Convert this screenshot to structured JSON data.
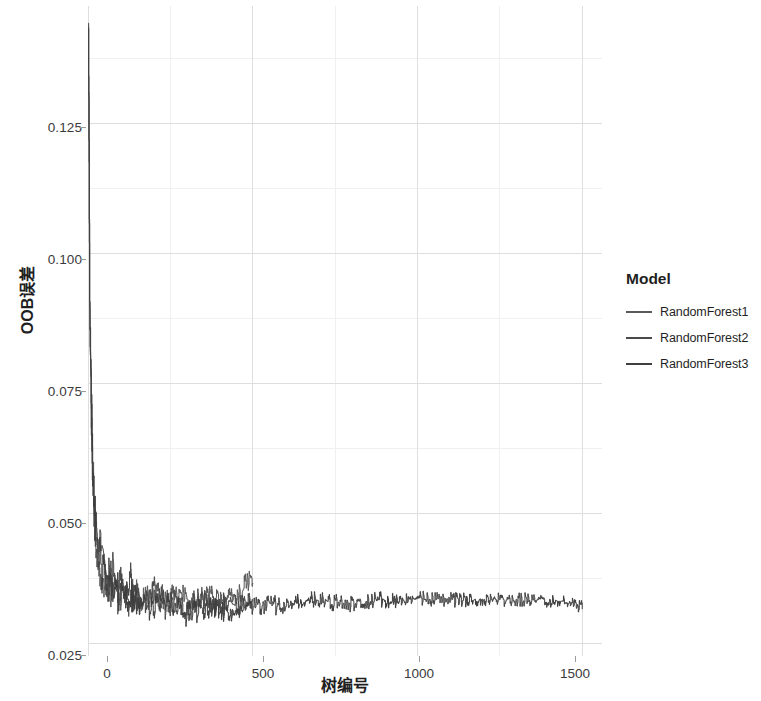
{
  "chart_data": {
    "type": "line",
    "title": "",
    "xlabel": "树编号",
    "ylabel": "OOB误差",
    "xlim": [
      0,
      1560
    ],
    "ylim": [
      0.0225,
      0.1475
    ],
    "xticks": [
      0,
      500,
      1000,
      1500
    ],
    "xticklabels": [
      "0",
      "500",
      "1000",
      "1500"
    ],
    "yticks": [
      0.025,
      0.05,
      0.075,
      0.1,
      0.125
    ],
    "yticklabels": [
      "0.025",
      "0.050",
      "0.075",
      "0.100",
      "0.125"
    ],
    "grid": true,
    "grid_minor": true,
    "legend_position": "right",
    "legend_title": "Model",
    "series": [
      {
        "name": "RandomForest1",
        "color": "#5a5a5a",
        "n_trees": 500,
        "x": [
          1,
          3,
          5,
          8,
          11,
          14,
          18,
          22,
          26,
          30,
          35,
          40,
          46,
          52,
          58,
          64,
          70,
          78,
          86,
          94,
          102,
          110,
          120,
          130,
          140,
          150,
          162,
          174,
          186,
          198,
          210,
          224,
          238,
          252,
          266,
          280,
          296,
          312,
          328,
          344,
          360,
          378,
          396,
          414,
          432,
          450,
          466,
          482,
          492,
          500
        ],
        "y": [
          0.1455,
          0.124,
          0.0935,
          0.0795,
          0.07,
          0.061,
          0.0545,
          0.049,
          0.0455,
          0.0425,
          0.0405,
          0.0395,
          0.038,
          0.0372,
          0.0365,
          0.036,
          0.0352,
          0.0348,
          0.0344,
          0.034,
          0.0338,
          0.0336,
          0.0334,
          0.034,
          0.0345,
          0.0338,
          0.0332,
          0.0336,
          0.0342,
          0.0346,
          0.034,
          0.0336,
          0.033,
          0.0334,
          0.0338,
          0.0342,
          0.0336,
          0.0332,
          0.033,
          0.0334,
          0.0338,
          0.0342,
          0.034,
          0.0336,
          0.0334,
          0.0338,
          0.035,
          0.0368,
          0.0372,
          0.037
        ]
      },
      {
        "name": "RandomForest2",
        "color": "#4a4a4a",
        "n_trees": 500,
        "x": [
          1,
          3,
          5,
          8,
          11,
          14,
          18,
          22,
          26,
          30,
          35,
          40,
          46,
          52,
          58,
          64,
          70,
          78,
          86,
          94,
          102,
          110,
          120,
          130,
          140,
          150,
          162,
          174,
          186,
          198,
          210,
          224,
          238,
          252,
          266,
          280,
          296,
          312,
          328,
          344,
          360,
          378,
          396,
          414,
          432,
          450,
          466,
          482,
          492,
          500
        ],
        "y": [
          0.1445,
          0.118,
          0.088,
          0.076,
          0.065,
          0.057,
          0.0505,
          0.0465,
          0.044,
          0.042,
          0.0475,
          0.0445,
          0.042,
          0.0398,
          0.0385,
          0.0375,
          0.0368,
          0.0392,
          0.0378,
          0.036,
          0.0352,
          0.0348,
          0.0358,
          0.037,
          0.0352,
          0.0344,
          0.0336,
          0.033,
          0.0342,
          0.0355,
          0.0348,
          0.033,
          0.0318,
          0.0326,
          0.0334,
          0.0322,
          0.031,
          0.0318,
          0.0328,
          0.0336,
          0.0326,
          0.0316,
          0.0324,
          0.0332,
          0.0328,
          0.032,
          0.0326,
          0.033,
          0.0328,
          0.0326
        ]
      },
      {
        "name": "RandomForest3",
        "color": "#3f3f3f",
        "n_trees": 1500,
        "x": [
          1,
          3,
          5,
          8,
          11,
          14,
          18,
          22,
          26,
          30,
          36,
          42,
          50,
          58,
          66,
          76,
          86,
          96,
          108,
          120,
          134,
          148,
          164,
          180,
          198,
          216,
          236,
          256,
          278,
          300,
          324,
          348,
          374,
          400,
          428,
          456,
          486,
          516,
          548,
          580,
          614,
          648,
          684,
          720,
          758,
          796,
          836,
          876,
          918,
          960,
          1004,
          1048,
          1094,
          1140,
          1188,
          1236,
          1286,
          1336,
          1388,
          1440,
          1470,
          1490,
          1500
        ],
        "y": [
          0.145,
          0.1205,
          0.0905,
          0.0775,
          0.0672,
          0.0588,
          0.0522,
          0.0476,
          0.0446,
          0.0422,
          0.0412,
          0.0398,
          0.038,
          0.037,
          0.0362,
          0.0354,
          0.0348,
          0.0342,
          0.0336,
          0.0332,
          0.0336,
          0.034,
          0.033,
          0.0322,
          0.0316,
          0.032,
          0.0326,
          0.0318,
          0.0312,
          0.0306,
          0.031,
          0.0316,
          0.032,
          0.0314,
          0.0308,
          0.0312,
          0.0318,
          0.0322,
          0.0326,
          0.032,
          0.0324,
          0.0328,
          0.0332,
          0.033,
          0.0328,
          0.0326,
          0.033,
          0.0334,
          0.0332,
          0.033,
          0.0334,
          0.0336,
          0.0334,
          0.0332,
          0.0336,
          0.0334,
          0.0332,
          0.0334,
          0.0332,
          0.033,
          0.0326,
          0.0318,
          0.0324
        ]
      }
    ]
  },
  "axes": {
    "y_title": "OOB误差",
    "x_title": "树编号",
    "y_ticklabels": [
      "0.125",
      "0.100",
      "0.075",
      "0.050",
      "0.025"
    ],
    "x_ticklabels": [
      "0",
      "500",
      "1000",
      "1500"
    ]
  },
  "legend": {
    "title": "Model",
    "items": [
      {
        "label": "RandomForest1",
        "color": "#5a5a5a"
      },
      {
        "label": "RandomForest2",
        "color": "#4a4a4a"
      },
      {
        "label": "RandomForest3",
        "color": "#3f3f3f"
      }
    ]
  },
  "style": {
    "panel_background": "#ffffff",
    "grid_major_color": "#dedede",
    "grid_minor_color": "#f0f0f0",
    "tick_color": "#9a9a9a",
    "text_color": "#1f1f1f"
  }
}
